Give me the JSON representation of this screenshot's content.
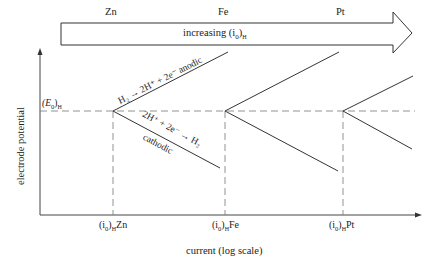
{
  "header_arrow": {
    "label": "increasing (i₀)ʜ",
    "label_main": "increasing (i",
    "label_sub0": "0",
    "label_close": ")",
    "label_subH": "H",
    "metals": [
      "Zn",
      "Fe",
      "Pt"
    ]
  },
  "axes": {
    "ylabel": "electrode potential",
    "xlabel": "current (log scale)",
    "e0_label_main": "(E",
    "e0_label_sub0": "0",
    "e0_label_close": ")",
    "e0_label_subH": "H"
  },
  "x_ticks": [
    {
      "main": "(i",
      "sub0": "0",
      "close": ")",
      "subH": "H",
      "metal": "Zn"
    },
    {
      "main": "(i",
      "sub0": "0",
      "close": ")",
      "subH": "H",
      "metal": "Fe"
    },
    {
      "main": "(i",
      "sub0": "0",
      "close": ")",
      "subH": "H",
      "metal": "Pt"
    }
  ],
  "annotations": {
    "anodic": "H₂ → 2H⁺ + 2e⁻ anodic",
    "cathodic_eq": "2H⁺ + 2e⁻ → H₂",
    "cathodic": "cathodic"
  }
}
